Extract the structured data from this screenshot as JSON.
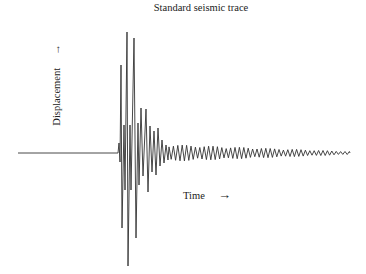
{
  "chart_data": {
    "type": "line",
    "title": "Standard seismic trace",
    "xlabel": "Time",
    "ylabel": "Displacement",
    "x_arrow": "→",
    "y_arrow": "→",
    "grid": false,
    "axes_visible": false,
    "baseline_y_px": 153,
    "x_start_px": 18,
    "onset_px": 118,
    "x_end_px": 350,
    "peaks": [
      {
        "x": 119,
        "y": 143
      },
      {
        "x": 120,
        "y": 162
      },
      {
        "x": 121,
        "y": 65
      },
      {
        "x": 122,
        "y": 228
      },
      {
        "x": 124,
        "y": 125
      },
      {
        "x": 125,
        "y": 190
      },
      {
        "x": 127,
        "y": 32
      },
      {
        "x": 128,
        "y": 266
      },
      {
        "x": 130,
        "y": 125
      },
      {
        "x": 131,
        "y": 190
      },
      {
        "x": 134,
        "y": 38
      },
      {
        "x": 136,
        "y": 238
      },
      {
        "x": 138,
        "y": 123
      },
      {
        "x": 139,
        "y": 185
      },
      {
        "x": 141,
        "y": 108
      },
      {
        "x": 143,
        "y": 176
      },
      {
        "x": 146,
        "y": 109
      },
      {
        "x": 148,
        "y": 192
      },
      {
        "x": 150,
        "y": 126
      },
      {
        "x": 152,
        "y": 172
      },
      {
        "x": 154,
        "y": 131
      },
      {
        "x": 156,
        "y": 175
      },
      {
        "x": 158,
        "y": 128
      },
      {
        "x": 160,
        "y": 166
      },
      {
        "x": 162,
        "y": 140
      },
      {
        "x": 164,
        "y": 163
      },
      {
        "x": 166,
        "y": 145
      },
      {
        "x": 168,
        "y": 160
      }
    ]
  },
  "labels": {
    "title": "Standard seismic trace",
    "ylabel": "Displacement",
    "y_arrow": "→",
    "xlabel": "Time",
    "x_arrow": "→"
  }
}
